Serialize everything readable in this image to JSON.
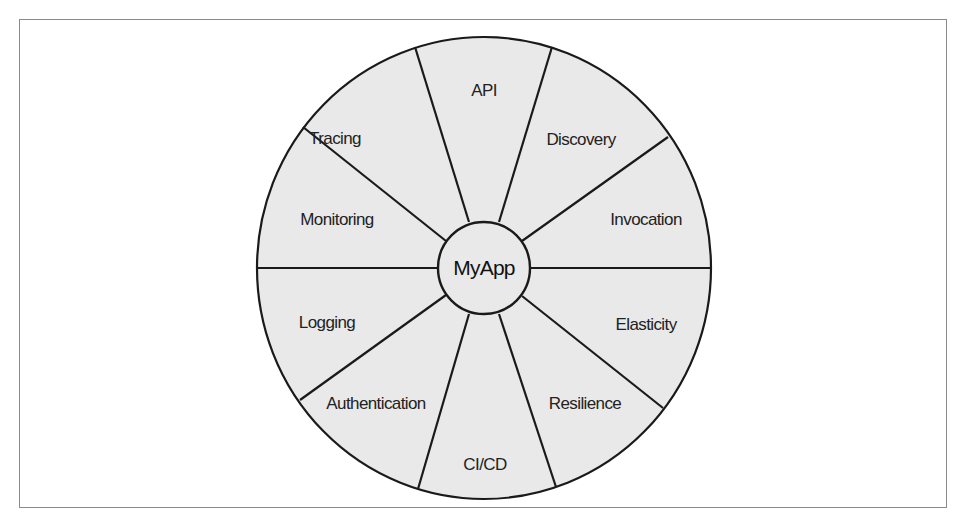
{
  "diagram": {
    "center_label": "MyApp",
    "colors": {
      "fill": "#e9e9e9",
      "stroke": "#1a1a1a",
      "text": "#222222",
      "frame": "#8a8a8a"
    },
    "segments": [
      {
        "label": "API"
      },
      {
        "label": "Discovery"
      },
      {
        "label": "Invocation"
      },
      {
        "label": "Elasticity"
      },
      {
        "label": "Resilience"
      },
      {
        "label": "CI/CD"
      },
      {
        "label": "Authentication"
      },
      {
        "label": "Logging"
      },
      {
        "label": "Monitoring"
      },
      {
        "label": "Tracing"
      }
    ]
  }
}
